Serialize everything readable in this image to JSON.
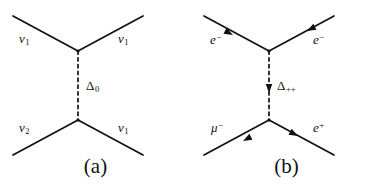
{
  "figure": {
    "background_color": "#ffffff",
    "line_color": "#111111",
    "panel_count": 2
  },
  "panels": [
    {
      "id": "a",
      "caption": "(a)",
      "propagator": {
        "label_base": "Δ",
        "label_sub": "0",
        "style": "dashed",
        "has_arrow": false
      },
      "legs": [
        {
          "position": "upper-left",
          "base": "ν",
          "sub": "1",
          "sup": "",
          "arrow": "none"
        },
        {
          "position": "upper-right",
          "base": "ν",
          "sub": "1",
          "sup": "",
          "arrow": "none"
        },
        {
          "position": "lower-left",
          "base": "ν",
          "sub": "2",
          "sup": "",
          "arrow": "none"
        },
        {
          "position": "lower-right",
          "base": "ν",
          "sub": "1",
          "sup": "",
          "arrow": "none"
        }
      ]
    },
    {
      "id": "b",
      "caption": "(b)",
      "propagator": {
        "label_base": "Δ",
        "label_sub": "++",
        "style": "dashed",
        "has_arrow": true,
        "arrow_direction": "down"
      },
      "legs": [
        {
          "position": "upper-left",
          "base": "e",
          "sub": "",
          "sup": "−",
          "arrow": "outward"
        },
        {
          "position": "upper-right",
          "base": "e",
          "sub": "",
          "sup": "−",
          "arrow": "outward"
        },
        {
          "position": "lower-left",
          "base": "μ",
          "sub": "",
          "sup": "−",
          "arrow": "inward"
        },
        {
          "position": "lower-right",
          "base": "e",
          "sub": "",
          "sup": "+",
          "arrow": "inward"
        }
      ]
    }
  ],
  "labels": {
    "a_upper_left_base": "ν",
    "a_upper_left_sub": "1",
    "a_upper_right_base": "ν",
    "a_upper_right_sub": "1",
    "a_lower_left_base": "ν",
    "a_lower_left_sub": "2",
    "a_lower_right_base": "ν",
    "a_lower_right_sub": "1",
    "a_propagator_base": "Δ",
    "a_propagator_sub": "0",
    "a_caption": "(a)",
    "b_upper_left_base": "e",
    "b_upper_left_sup": "−",
    "b_upper_right_base": "e",
    "b_upper_right_sup": "−",
    "b_lower_left_base": "μ",
    "b_lower_left_sup": "−",
    "b_lower_right_base": "e",
    "b_lower_right_sup": "+",
    "b_propagator_base": "Δ",
    "b_propagator_sub": "++",
    "b_caption": "(b)"
  }
}
